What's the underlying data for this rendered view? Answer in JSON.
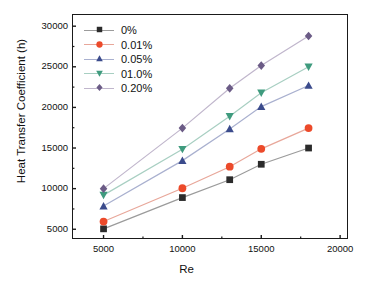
{
  "chart_data": {
    "type": "line",
    "title": "",
    "xlabel": "Re",
    "ylabel": "Heat Transfer Coefficient (h)",
    "x": [
      5000,
      10000,
      13000,
      15000,
      18000
    ],
    "xlim": [
      3000,
      20500
    ],
    "ylim": [
      3800,
      31500
    ],
    "xticks": [
      "5000",
      "10000",
      "15000",
      "20000"
    ],
    "xtick_values": [
      5000,
      10000,
      15000,
      20000
    ],
    "yticks": [
      "5000",
      "10000",
      "15000",
      "20000",
      "25000",
      "30000"
    ],
    "ytick_values": [
      5000,
      10000,
      15000,
      20000,
      25000,
      30000
    ],
    "grid": false,
    "legend_position": "top-left",
    "series": [
      {
        "name": "0%",
        "color": "#2b2b2b",
        "line_color": "#9b9b9b",
        "marker": "square",
        "values": [
          5050,
          8900,
          11100,
          13000,
          15000
        ]
      },
      {
        "name": "0.01%",
        "color": "#ec4a2a",
        "line_color": "#e8a79a",
        "marker": "circle",
        "values": [
          5950,
          10050,
          12700,
          14900,
          17450
        ]
      },
      {
        "name": "0.05%",
        "color": "#3b4b8c",
        "line_color": "#a9b0cf",
        "marker": "triangle-up",
        "values": [
          7850,
          13450,
          17350,
          20100,
          22700
        ]
      },
      {
        "name": "01.0%",
        "color": "#3f9b7e",
        "line_color": "#a8cfc2",
        "marker": "triangle-down",
        "values": [
          9200,
          14850,
          18900,
          21800,
          25000
        ]
      },
      {
        "name": "0.20%",
        "color": "#6b5b86",
        "line_color": "#c0b6cc",
        "marker": "diamond",
        "values": [
          10000,
          17450,
          22350,
          25150,
          28800
        ]
      }
    ]
  }
}
